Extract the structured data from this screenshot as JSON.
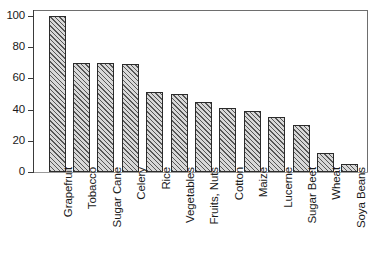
{
  "chart_data": {
    "type": "bar",
    "title": "",
    "subtitle": "",
    "xlabel": "",
    "ylabel": "",
    "ylim": [
      0,
      100
    ],
    "yticks": [
      0,
      20,
      40,
      60,
      80,
      100
    ],
    "ytick_labels": [
      "0",
      "20",
      "40",
      "60",
      "80",
      "100"
    ],
    "grid": false,
    "legend": false,
    "legend_position": "none",
    "orientation": "vertical",
    "bar_fill": "diagonal-hatch",
    "bar_edge_color": "#2b2b2b",
    "bar_face_color": "#d8d8d8",
    "axis_color": "#3a3a3a",
    "categories": [
      "Grapefruit",
      "Tobacco",
      "Sugar Cane",
      "Celery",
      "Rice",
      "Vegetables",
      "Fruits, Nuts",
      "Cotton",
      "Maize",
      "Lucerne",
      "Sugar Beet",
      "Wheat",
      "Soya Beans"
    ],
    "values": [
      100,
      70,
      70,
      69,
      51,
      50,
      45,
      41,
      39,
      35,
      30,
      12,
      5
    ]
  }
}
